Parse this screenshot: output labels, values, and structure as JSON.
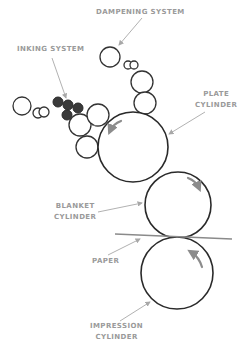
{
  "diagram": {
    "type": "offset lithography press schematic",
    "labels": {
      "dampening_system": "DAMPENING SYSTEM",
      "inking_system": "INKING SYSTEM",
      "plate_cylinder_line1": "PLATE",
      "plate_cylinder_line2": "CYLINDER",
      "blanket_cylinder_line1": "BLANKET",
      "blanket_cylinder_line2": "CYLINDER",
      "paper": "PAPER",
      "impression_cylinder_line1": "IMPRESSION",
      "impression_cylinder_line2": "CYLINDER"
    },
    "components": [
      {
        "name": "Dampening system",
        "parts": "water rollers chain above plate cylinder"
      },
      {
        "name": "Inking system",
        "parts": "ink rollers, some dark (inked)"
      },
      {
        "name": "Plate cylinder",
        "rotation": "counter-clockwise"
      },
      {
        "name": "Blanket cylinder",
        "rotation": "clockwise"
      },
      {
        "name": "Paper",
        "passes": "between blanket and impression cylinders"
      },
      {
        "name": "Impression cylinder",
        "rotation": "counter-clockwise"
      }
    ],
    "colors": {
      "outline": "#2a2a2a",
      "label_text": "#9a9a9a",
      "leader_lines": "#a8a8a8",
      "ink_rollers": "#3a3a3a"
    }
  }
}
